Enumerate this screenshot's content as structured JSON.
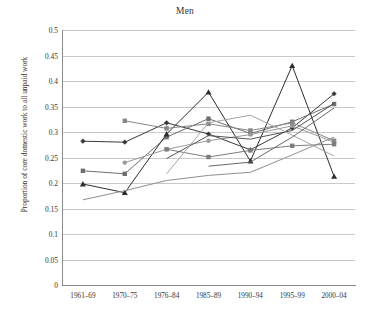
{
  "chart_data": {
    "type": "line",
    "title": "Men",
    "xlabel": "",
    "ylabel": "Proportion of core domestic work to all unpaid work",
    "categories": [
      "1961–69",
      "1970–75",
      "1976–84",
      "1985–89",
      "1990–94",
      "1995–99",
      "2000–04"
    ],
    "ylim": [
      0,
      0.5
    ],
    "yticks": [
      "0",
      "0.05",
      "0.1",
      "0.15",
      "0.2",
      "0.25",
      "0.3",
      "0.35",
      "0.4",
      "0.45",
      "0.5"
    ],
    "ytick_values": [
      0,
      0.05,
      0.1,
      0.15,
      0.2,
      0.25,
      0.3,
      0.35,
      0.4,
      0.45,
      0.5
    ],
    "grid": "horizontal",
    "legend": "none",
    "series": [
      {
        "name": "series-1",
        "marker": "diamond",
        "color": "#3a3a3a",
        "values": [
          0.282,
          0.28,
          0.318,
          0.296,
          0.265,
          0.308,
          0.375
        ]
      },
      {
        "name": "series-2",
        "marker": "square",
        "color": "#6e6e6e",
        "values": [
          0.224,
          0.218,
          0.29,
          0.326,
          0.297,
          0.32,
          0.355
        ]
      },
      {
        "name": "series-3",
        "marker": "triangle",
        "color": "#2e2e2e",
        "values": [
          0.198,
          0.181,
          0.296,
          0.378,
          0.243,
          0.43,
          0.213
        ]
      },
      {
        "name": "series-4",
        "marker": "none",
        "color": "#8f8f8f",
        "values": [
          0.167,
          0.185,
          0.205,
          0.215,
          0.221,
          0.255,
          0.29
        ]
      },
      {
        "name": "series-5",
        "marker": "circle",
        "color": "#9a9a9a",
        "values": [
          null,
          0.24,
          0.266,
          0.283,
          0.295,
          0.312,
          0.28
        ]
      },
      {
        "name": "series-6",
        "marker": "square",
        "color": "#878787",
        "values": [
          null,
          0.322,
          0.307,
          0.316,
          0.303,
          0.318,
          0.283
        ]
      },
      {
        "name": "series-7",
        "marker": "square",
        "color": "#7d7d7d",
        "values": [
          null,
          null,
          0.266,
          0.251,
          0.264,
          0.273,
          0.276
        ]
      },
      {
        "name": "series-8",
        "marker": "none",
        "color": "#555555",
        "values": [
          null,
          null,
          0.248,
          0.293,
          0.286,
          0.303,
          0.356
        ]
      },
      {
        "name": "series-9",
        "marker": "none",
        "color": "#a5a5a5",
        "values": [
          null,
          null,
          0.218,
          0.318,
          0.333,
          0.294,
          0.253
        ]
      },
      {
        "name": "series-10",
        "marker": "none",
        "color": "#6a6a6a",
        "values": [
          null,
          null,
          null,
          0.233,
          0.241,
          0.29,
          0.347
        ]
      }
    ]
  }
}
